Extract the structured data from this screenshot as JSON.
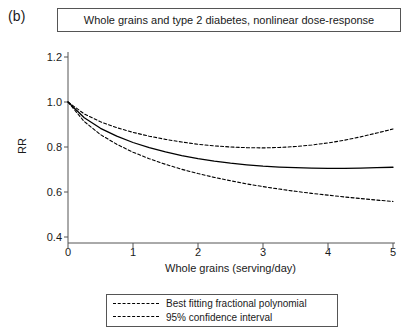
{
  "panel": {
    "label": "(b)"
  },
  "title": {
    "text": "Whole grains and type 2 diabetes, nonlinear dose-response"
  },
  "axes": {
    "xlabel": "Whole grains (serving/day)",
    "ylabel": "RR",
    "xticks": [
      "0",
      "1",
      "2",
      "3",
      "4",
      "5"
    ],
    "yticks": [
      "1.2",
      "1.0",
      "0.8",
      "0.6",
      "0.4"
    ]
  },
  "legend": {
    "items": [
      {
        "label": "Best fitting fractional polynomial",
        "style": "solid"
      },
      {
        "label": "95% confidence interval",
        "style": "dashed"
      }
    ]
  },
  "colors": {
    "line": "#000000",
    "axis": "#555555",
    "background": "#ffffff"
  },
  "chart_data": {
    "type": "line",
    "title": "Whole grains and type 2 diabetes, nonlinear dose-response",
    "xlabel": "Whole grains (serving/day)",
    "ylabel": "RR",
    "xlim": [
      0,
      5
    ],
    "ylim": [
      0.4,
      1.2
    ],
    "xticks": [
      0,
      1,
      2,
      3,
      4,
      5
    ],
    "yticks": [
      0.4,
      0.6,
      0.8,
      1.0,
      1.2
    ],
    "grid": false,
    "legend_position": "below-axes",
    "x": [
      0,
      0.25,
      0.5,
      0.75,
      1.0,
      1.25,
      1.5,
      1.75,
      2.0,
      2.25,
      2.5,
      2.75,
      3.0,
      3.25,
      3.5,
      3.75,
      4.0,
      4.25,
      4.5,
      4.75,
      5.0
    ],
    "series": [
      {
        "name": "Best fitting fractional polynomial",
        "style": "solid",
        "values": [
          1.0,
          0.93,
          0.883,
          0.848,
          0.82,
          0.797,
          0.778,
          0.762,
          0.748,
          0.737,
          0.728,
          0.721,
          0.715,
          0.711,
          0.708,
          0.706,
          0.705,
          0.705,
          0.706,
          0.708,
          0.71
        ]
      },
      {
        "name": "95% confidence interval upper",
        "style": "dashed",
        "values": [
          1.0,
          0.947,
          0.912,
          0.886,
          0.865,
          0.848,
          0.834,
          0.822,
          0.812,
          0.805,
          0.8,
          0.797,
          0.796,
          0.798,
          0.802,
          0.809,
          0.818,
          0.83,
          0.845,
          0.862,
          0.88
        ]
      },
      {
        "name": "95% confidence interval lower",
        "style": "dashed",
        "values": [
          1.0,
          0.913,
          0.855,
          0.812,
          0.777,
          0.748,
          0.723,
          0.701,
          0.682,
          0.665,
          0.65,
          0.636,
          0.624,
          0.613,
          0.603,
          0.594,
          0.586,
          0.578,
          0.571,
          0.564,
          0.558
        ]
      }
    ]
  }
}
